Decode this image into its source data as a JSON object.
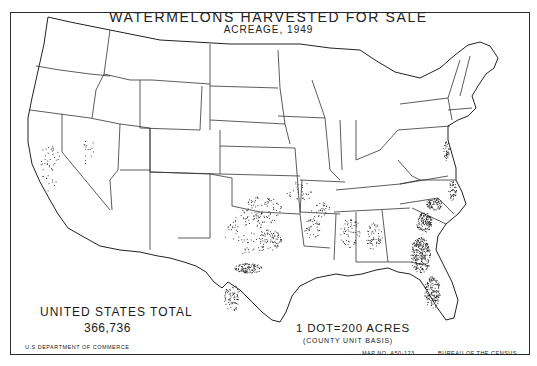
{
  "map": {
    "title": "WATERMELONS HARVESTED FOR SALE",
    "subtitle": "ACREAGE, 1949",
    "total_label": "UNITED STATES TOTAL",
    "total_value": "366,736",
    "legend": {
      "dot_value": "1 DOT=200 ACRES",
      "basis": "(COUNTY UNIT BASIS)"
    },
    "footer": {
      "agency": "U.S DEPARTMENT OF COMMERCE",
      "map_number": "MAP NO. A50-123",
      "bureau": "BUREAU OF THE CENSUS"
    },
    "colors": {
      "ink": "#1a1a1a",
      "background": "#ffffff"
    },
    "dot_regions": [
      {
        "name": "Georgia-Florida",
        "density": "very high"
      },
      {
        "name": "South Carolina",
        "density": "high"
      },
      {
        "name": "North Carolina",
        "density": "medium"
      },
      {
        "name": "Texas",
        "density": "high"
      },
      {
        "name": "Oklahoma",
        "density": "medium"
      },
      {
        "name": "Alabama-Mississippi",
        "density": "medium"
      },
      {
        "name": "California",
        "density": "low"
      },
      {
        "name": "Delmarva",
        "density": "medium"
      },
      {
        "name": "Arkansas-Missouri",
        "density": "low"
      }
    ]
  }
}
